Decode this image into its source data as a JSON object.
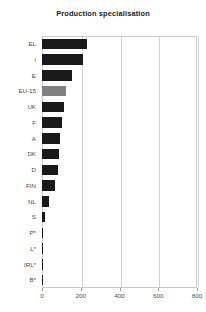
{
  "chart_data": {
    "type": "bar",
    "orientation": "horizontal",
    "title": "Production specialisation",
    "xlabel": "",
    "ylabel": "",
    "xlim": [
      0,
      800
    ],
    "xticks": [
      0,
      200,
      400,
      600,
      800
    ],
    "xtick_labels": [
      "0",
      "200",
      "400",
      "600",
      "800"
    ],
    "grid": true,
    "legend": "none",
    "categories": [
      "EL",
      "I",
      "E",
      "EU-15",
      "UK",
      "F",
      "A",
      "DK",
      "D",
      "FIN",
      "NL",
      "S",
      "P*",
      "L*",
      "IRL*",
      "B*"
    ],
    "values": [
      230,
      210,
      155,
      125,
      115,
      105,
      95,
      90,
      80,
      65,
      35,
      18,
      2,
      2,
      2,
      2
    ],
    "bar_colors": [
      "#1a1a1a",
      "#1a1a1a",
      "#1a1a1a",
      "#808080",
      "#1a1a1a",
      "#1a1a1a",
      "#1a1a1a",
      "#1a1a1a",
      "#1a1a1a",
      "#1a1a1a",
      "#1a1a1a",
      "#1a1a1a",
      "#1a1a1a",
      "#1a1a1a",
      "#1a1a1a",
      "#1a1a1a"
    ],
    "highlight_category": "EU-15",
    "colors": {
      "bar_default": "#1a1a1a",
      "bar_highlight": "#808080",
      "grid": "#d2d2d2",
      "frame": "#c8c8c8",
      "text": "#4a4a4a",
      "title_text": "#1a1a1a",
      "background": "#ffffff"
    }
  }
}
